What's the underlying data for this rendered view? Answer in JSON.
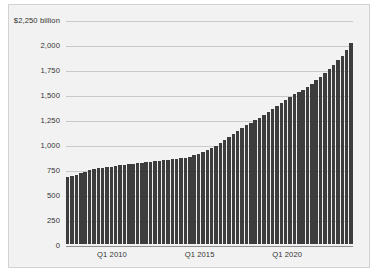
{
  "chart_data": {
    "type": "bar",
    "title": "",
    "subtitle": "",
    "xlabel": "",
    "ylabel": "$2,250 billion",
    "ylim": [
      0,
      2250
    ],
    "grid": true,
    "legend": null,
    "y_ticks": [
      {
        "value": 2250,
        "label": "$2,250 billion"
      },
      {
        "value": 2000,
        "label": "2,000"
      },
      {
        "value": 1750,
        "label": "1,750"
      },
      {
        "value": 1500,
        "label": "1,500"
      },
      {
        "value": 1250,
        "label": "1,250"
      },
      {
        "value": 1000,
        "label": "1,000"
      },
      {
        "value": 750,
        "label": "750"
      },
      {
        "value": 500,
        "label": "500"
      },
      {
        "value": 250,
        "label": "250"
      },
      {
        "value": 0,
        "label": "0"
      }
    ],
    "x_ticks": [
      {
        "index": 10,
        "label": "Q1 2010"
      },
      {
        "index": 30,
        "label": "Q1 2015"
      },
      {
        "index": 50,
        "label": "Q1 2020"
      }
    ],
    "categories": [
      "Q1 2007",
      "Q2 2007",
      "Q3 2007",
      "Q4 2007",
      "Q1 2008",
      "Q2 2008",
      "Q3 2008",
      "Q4 2008",
      "Q1 2009",
      "Q2 2009",
      "Q3 2009",
      "Q4 2009",
      "Q1 2010",
      "Q2 2010",
      "Q3 2010",
      "Q4 2010",
      "Q1 2011",
      "Q2 2011",
      "Q3 2011",
      "Q4 2011",
      "Q1 2012",
      "Q2 2012",
      "Q3 2012",
      "Q4 2012",
      "Q1 2013",
      "Q2 2013",
      "Q3 2013",
      "Q4 2013",
      "Q1 2014",
      "Q2 2014",
      "Q3 2014",
      "Q4 2014",
      "Q1 2015",
      "Q2 2015",
      "Q3 2015",
      "Q4 2015",
      "Q1 2016",
      "Q2 2016",
      "Q3 2016",
      "Q4 2016",
      "Q1 2017",
      "Q2 2017",
      "Q3 2017",
      "Q4 2017",
      "Q1 2018",
      "Q2 2018",
      "Q3 2018",
      "Q4 2018",
      "Q1 2019",
      "Q2 2019",
      "Q3 2019",
      "Q4 2019",
      "Q1 2020",
      "Q2 2020",
      "Q3 2020",
      "Q4 2020",
      "Q1 2021",
      "Q2 2021",
      "Q3 2021",
      "Q4 2021",
      "Q1 2022",
      "Q2 2022",
      "Q3 2022",
      "Q4 2022",
      "Q1 2023",
      "Q2 2023"
    ],
    "values": [
      670,
      680,
      695,
      710,
      725,
      740,
      755,
      760,
      765,
      770,
      775,
      780,
      790,
      795,
      800,
      805,
      810,
      815,
      820,
      825,
      830,
      835,
      840,
      845,
      850,
      855,
      860,
      865,
      875,
      890,
      905,
      920,
      940,
      960,
      985,
      1010,
      1040,
      1070,
      1100,
      1130,
      1160,
      1190,
      1215,
      1240,
      1265,
      1290,
      1320,
      1350,
      1380,
      1410,
      1440,
      1470,
      1500,
      1520,
      1545,
      1575,
      1605,
      1640,
      1675,
      1710,
      1750,
      1795,
      1840,
      1885,
      1945,
      2010
    ]
  }
}
